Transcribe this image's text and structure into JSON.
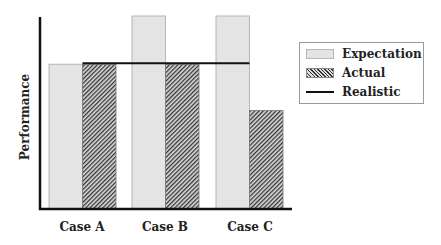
{
  "chart_data": {
    "type": "bar",
    "title": "",
    "xlabel": "",
    "ylabel": "Performance",
    "categories": [
      "Case A",
      "Case B",
      "Case C"
    ],
    "series": [
      {
        "name": "Expectation",
        "values": [
          75,
          100,
          100
        ],
        "style": "light-gray-fill",
        "color": "#e4e4e4"
      },
      {
        "name": "Actual",
        "values": [
          75,
          75,
          51
        ],
        "style": "diagonal-hatch",
        "color": "#555555"
      },
      {
        "name": "Realistic",
        "values": [
          75,
          75,
          75
        ],
        "style": "horizontal-line",
        "color": "#111111"
      }
    ],
    "ylim": [
      0,
      100
    ],
    "grid": false,
    "y_ticks_shown": false,
    "legend_position": "right"
  },
  "legend": {
    "items": [
      {
        "label": "Expectation"
      },
      {
        "label": "Actual"
      },
      {
        "label": "Realistic"
      }
    ]
  },
  "axes": {
    "ylabel": "Performance",
    "xticks": [
      "Case A",
      "Case B",
      "Case C"
    ]
  }
}
